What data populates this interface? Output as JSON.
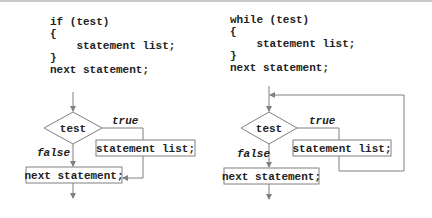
{
  "if_diagram": {
    "code_lines": [
      "if (test)",
      "{",
      "    statement list;",
      "}",
      "next statement;"
    ],
    "condition_label": "test",
    "true_label": "true",
    "false_label": "false",
    "body_label": "statement list;",
    "next_label": "next statement;"
  },
  "while_diagram": {
    "code_lines": [
      "while (test)",
      "{",
      "    statement list;",
      "}",
      "next statement;"
    ],
    "condition_label": "test",
    "true_label": "true",
    "false_label": "false",
    "body_label": "statement list;",
    "next_label": "next statement;"
  },
  "colors": {
    "line": "#808080",
    "text": "#222222",
    "box_border": "#808080"
  }
}
